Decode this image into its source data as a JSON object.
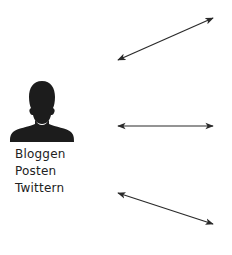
{
  "diagram": {
    "person": {
      "icon": "person-silhouette-icon",
      "color": "#1c1c1c"
    },
    "labels": [
      "Bloggen",
      "Posten",
      "Twittern"
    ],
    "arrows": [
      {
        "name": "arrow-upper",
        "x1": 118,
        "y1": 60,
        "x2": 213,
        "y2": 18,
        "bidirectional": true
      },
      {
        "name": "arrow-middle",
        "x1": 118,
        "y1": 126,
        "x2": 213,
        "y2": 126,
        "bidirectional": true
      },
      {
        "name": "arrow-lower",
        "x1": 118,
        "y1": 193,
        "x2": 213,
        "y2": 224,
        "bidirectional": true
      }
    ],
    "arrow_color": "#2a2a2a"
  }
}
